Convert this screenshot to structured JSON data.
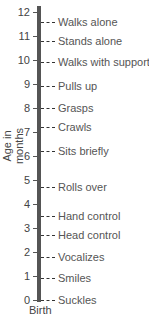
{
  "chart_data": {
    "type": "timeline",
    "title": "",
    "ylabel": "Age in months",
    "xlabel": "Birth",
    "ylim": [
      0,
      12
    ],
    "yticks": [
      0,
      1,
      2,
      3,
      4,
      5,
      6,
      7,
      8,
      9,
      10,
      11,
      12
    ],
    "milestones": [
      {
        "label": "Walks alone",
        "month": 11.6
      },
      {
        "label": "Stands alone",
        "month": 10.8
      },
      {
        "label": "Walks with support",
        "month": 9.9
      },
      {
        "label": "Pulls up",
        "month": 8.9
      },
      {
        "label": "Grasps",
        "month": 8.0
      },
      {
        "label": "Crawls",
        "month": 7.2
      },
      {
        "label": "Sits briefly",
        "month": 6.2
      },
      {
        "label": "Rolls over",
        "month": 4.7
      },
      {
        "label": "Hand control",
        "month": 3.5
      },
      {
        "label": "Head control",
        "month": 2.7
      },
      {
        "label": "Vocalizes",
        "month": 1.8
      },
      {
        "label": "Smiles",
        "month": 0.9
      },
      {
        "label": "Suckles",
        "month": 0.0
      }
    ]
  }
}
